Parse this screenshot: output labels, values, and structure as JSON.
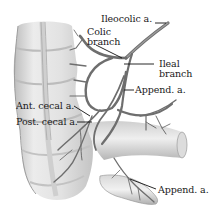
{
  "figure": {
    "colors": {
      "background": "#ffffff",
      "bowel_fill": "#e6e6e6",
      "bowel_shadow": "#b8b8b8",
      "artery": "#6e6e6e",
      "artery_dark": "#3c3c3c",
      "leader_line": "#111111",
      "label_text": "#1a1a1a"
    },
    "labels": [
      {
        "id": "ileocolic",
        "text": "Ileocolic a."
      },
      {
        "id": "colic_branch_line1",
        "text": "Colic"
      },
      {
        "id": "colic_branch_line2",
        "text": "branch"
      },
      {
        "id": "ileal_branch_line1",
        "text": "Ileal"
      },
      {
        "id": "ileal_branch_line2",
        "text": "branch"
      },
      {
        "id": "append_upper",
        "text": "Append. a."
      },
      {
        "id": "ant_cecal",
        "text": "Ant. cecal a."
      },
      {
        "id": "post_cecal",
        "text": "Post. cecal a."
      },
      {
        "id": "append_lower",
        "text": "Append. a."
      }
    ]
  }
}
